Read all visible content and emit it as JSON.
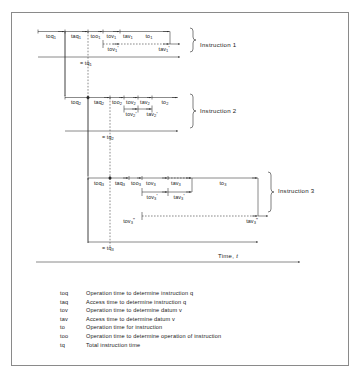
{
  "figure": {
    "axis_label": "Time, t",
    "brace_labels": [
      "Instruction 1",
      "Instruction 2",
      "Instruction 3"
    ]
  },
  "instruction1": {
    "top_segments": [
      "toq1",
      "taq1",
      "too1",
      "tov1",
      "tav1",
      "to1"
    ],
    "bottom_segments": [
      "tov1'",
      "tav1'"
    ],
    "total_label": "tq1",
    "segments_text": {
      "toq": "toq",
      "taq": "taq",
      "too": "too",
      "tov": "tov",
      "tav": "tav",
      "to": "to",
      "tq": "tq"
    },
    "subscript": "1"
  },
  "instruction2": {
    "top_segments": [
      "toq2",
      "taq2",
      "too2",
      "tov2",
      "tav2",
      "to2"
    ],
    "bottom_segments": [
      "tov2'",
      "tav2'"
    ],
    "total_label": "tq2",
    "subscript": "2"
  },
  "instruction3": {
    "top_segments": [
      "toq3",
      "taq3",
      "too3",
      "tov3",
      "tav3",
      "to3"
    ],
    "mid_segments": [
      "tov3'",
      "tav3'"
    ],
    "bottom_segments": [
      "tov3''",
      "tav3''"
    ],
    "total_label": "tq3",
    "subscript": "3"
  },
  "legend": [
    {
      "symbol": "toq",
      "text": "Operation time to determine instruction q"
    },
    {
      "symbol": "taq",
      "text": "Access time to determine instruction q"
    },
    {
      "symbol": "tov",
      "text": "Operation time to determine datum v"
    },
    {
      "symbol": "tav",
      "text": "Access time to determine datum v"
    },
    {
      "symbol": "to",
      "text": "Operation time for instruction"
    },
    {
      "symbol": "too",
      "text": "Operation time to determine operation of instruction"
    },
    {
      "symbol": "tq",
      "text": "Total instruction time"
    }
  ],
  "colors": {
    "line": "#2a2a2a",
    "frame": "#8a8a8a",
    "background": "#ffffff"
  }
}
